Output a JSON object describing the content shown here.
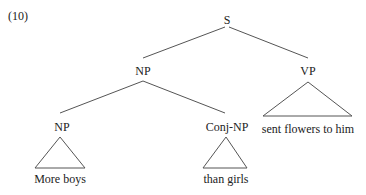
{
  "example_number": "(10)",
  "tree": {
    "root": "S",
    "nodes": {
      "s": "S",
      "np_top": "NP",
      "vp": "VP",
      "np_low": "NP",
      "conj_np": "Conj-NP"
    },
    "leaves": {
      "vp_leaf": "sent flowers to him",
      "np_leaf": "More boys",
      "conj_leaf": "than girls"
    }
  },
  "colors": {
    "line": "#555555",
    "text": "#222222"
  }
}
